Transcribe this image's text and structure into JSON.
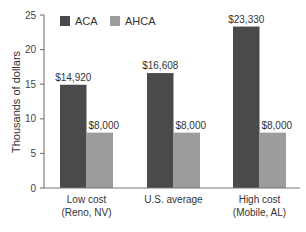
{
  "chart_data": {
    "type": "bar",
    "title": "",
    "xlabel": "",
    "ylabel": "Thousands of dollars",
    "ylim": [
      0,
      25
    ],
    "yticks": [
      0,
      5,
      10,
      15,
      20,
      25
    ],
    "grid": false,
    "legend_position": "top-left",
    "categories": [
      {
        "line1": "Low cost",
        "line2": "(Reno, NV)"
      },
      {
        "line1": "U.S. average",
        "line2": ""
      },
      {
        "line1": "High cost",
        "line2": "(Mobile, AL)"
      }
    ],
    "series": [
      {
        "name": "ACA",
        "color": "#4a4a4a",
        "values": [
          14.92,
          16.608,
          23.33
        ],
        "labels": [
          "$14,920",
          "$16,608",
          "$23,330"
        ]
      },
      {
        "name": "AHCA",
        "color": "#9c9c9c",
        "values": [
          8.0,
          8.0,
          8.0
        ],
        "labels": [
          "$8,000",
          "$8,000",
          "$8,000"
        ]
      }
    ]
  },
  "legend": {
    "items": [
      {
        "label": "ACA",
        "color": "#4a4a4a"
      },
      {
        "label": "AHCA",
        "color": "#9c9c9c"
      }
    ]
  }
}
